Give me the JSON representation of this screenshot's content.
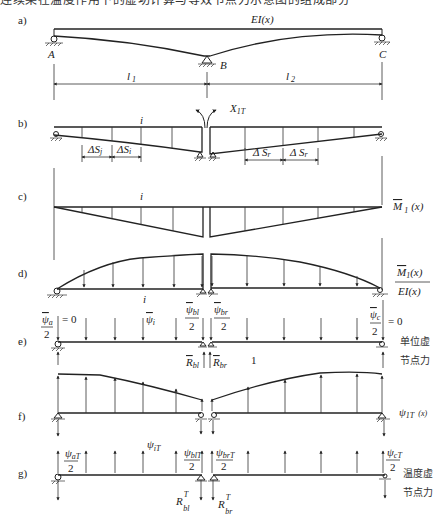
{
  "caption_fragment": "连续梁在温度作用下的虚功计算与等效节点力示意图的组成部分",
  "panels": {
    "a": {
      "tag": "a)",
      "stiffness_label": "EI(x)",
      "support_left": "A",
      "support_mid": "B",
      "support_right": "C",
      "span1": "l",
      "span1_sub": "1",
      "span2": "l",
      "span2_sub": "2"
    },
    "b": {
      "tag": "b)",
      "segment_label": "i",
      "redundant": "X",
      "redundant_sub": "1T",
      "ds_left_1": "ΔS",
      "ds_left_1_sub": "j",
      "ds_left_2": "ΔS",
      "ds_left_2_sub": "i",
      "ds_right_1": "Δ S",
      "ds_right_1_sub": "r",
      "ds_right_2": "Δ S",
      "ds_right_2_sub": "r"
    },
    "c": {
      "tag": "c)",
      "segment_label": "i",
      "moment_label": "M",
      "moment_sub": "1",
      "moment_arg": "(x)"
    },
    "d": {
      "tag": "d)",
      "segment_label": "i",
      "num": "M",
      "num_sub": "1",
      "num_arg": "(x)",
      "den": "EI(x)"
    },
    "e": {
      "tag": "e)",
      "psi_a": "ψ",
      "psi_a_sub": "a",
      "psi_a_den": "2",
      "psi_a_eq": "= 0",
      "psi_i": "ψ",
      "psi_i_sub": "i",
      "psi_bl": "ψ",
      "psi_bl_sub": "bl",
      "psi_bl_den": "2",
      "psi_br": "ψ",
      "psi_br_sub": "br",
      "psi_br_den": "2",
      "psi_c": "ψ",
      "psi_c_sub": "c",
      "psi_c_den": "2",
      "psi_c_eq": "= 0",
      "r_bl": "R",
      "r_bl_sub": "bl",
      "r_br": "R",
      "r_br_sub": "br",
      "unit": "1",
      "note_line1": "单位虚",
      "note_line2": "节点力"
    },
    "f": {
      "tag": "f)",
      "label": "ψ",
      "label_sub": "1T",
      "label_arg": "(x)"
    },
    "g": {
      "tag": "g)",
      "psi_aT": "ψ",
      "psi_aT_sub": "aT",
      "psi_aT_den": "2",
      "psi_iT": "ψ",
      "psi_iT_sub": "iT",
      "psi_blT": "ψ",
      "psi_blT_sub": "blT",
      "psi_blT_den": "2",
      "psi_brT": "ψ",
      "psi_brT_sub": "brT",
      "psi_brT_den": "2",
      "psi_cT": "ψ",
      "psi_cT_sub": "cT",
      "psi_cT_den": "2",
      "r_blT": "R",
      "r_blT_sub": "bl",
      "r_blT_sup": "T",
      "r_brT": "R",
      "r_brT_sub": "br",
      "r_brT_sup": "T",
      "note_line1": "温度虚",
      "note_line2": "节点力"
    }
  },
  "colors": {
    "ink": "#222222",
    "background": "#ffffff"
  }
}
